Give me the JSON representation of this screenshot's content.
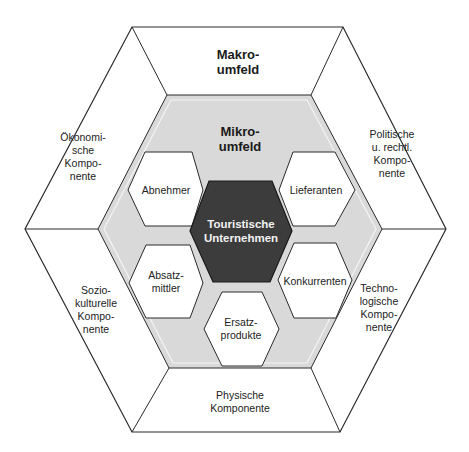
{
  "diagram": {
    "macro": {
      "title": "Makro-\numfeld",
      "segments": [
        {
          "id": "oekonomisch",
          "label": "Ökonomi-\nsche\nKompo-\nnente"
        },
        {
          "id": "politisch",
          "label": "Politische\nu. rechtl.\nKompo-\nnente"
        },
        {
          "id": "soziokulturell",
          "label": "Sozio-\nkulturelle\nKompo-\nnente"
        },
        {
          "id": "technologisch",
          "label": "Techno-\nlogische\nKompo-\nnente"
        },
        {
          "id": "physisch",
          "label": "Physische\nKomponente"
        }
      ]
    },
    "micro": {
      "title": "Mikro-\numfeld",
      "center": "Touristische\nUnternehmen",
      "hexes": [
        {
          "id": "abnehmer",
          "label": "Abnehmer"
        },
        {
          "id": "lieferanten",
          "label": "Lieferanten"
        },
        {
          "id": "absatzmittler",
          "label": "Absatz-\nmittler"
        },
        {
          "id": "konkurrenten",
          "label": "Konkurrenten"
        },
        {
          "id": "ersatzprodukte",
          "label": "Ersatz-\nprodukte"
        }
      ]
    },
    "colors": {
      "line": "#2a2a2a",
      "micro_fill": "#d9d9d9",
      "center_fill": "#3c3c3c",
      "rule": "#8a8a8a"
    }
  }
}
